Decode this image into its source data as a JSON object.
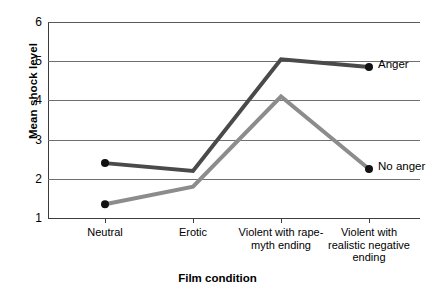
{
  "chart_data": {
    "type": "line",
    "title": "",
    "xlabel": "Film condition",
    "ylabel": "Mean shock level",
    "categories": [
      "Neutral",
      "Erotic",
      "Violent with rape-myth ending",
      "Violent with realistic negative ending"
    ],
    "series": [
      {
        "name": "Anger",
        "values": [
          2.4,
          2.2,
          5.05,
          4.85
        ],
        "color": "#4a4a4a"
      },
      {
        "name": "No anger",
        "values": [
          1.35,
          1.8,
          4.1,
          2.25
        ],
        "color": "#8c8c8c"
      }
    ],
    "ylim": [
      1,
      6
    ],
    "yticks": [
      1,
      2,
      3,
      4,
      5,
      6
    ],
    "ytick_labels": [
      "1",
      "2",
      "3",
      "4",
      "5",
      "6"
    ],
    "grid": true,
    "legend_position": "inline-right-of-last-point",
    "marker": "filled-circle-at-first-and-last-point"
  },
  "axis": {
    "y_title": "Mean shock level",
    "x_title": "Film condition",
    "y_tick_labels": [
      "6",
      "5",
      "4",
      "3",
      "2",
      "1"
    ],
    "x_tick_labels": [
      [
        "Neutral"
      ],
      [
        "Erotic"
      ],
      [
        "Violent with rape-",
        "myth ending"
      ],
      [
        "Violent with",
        "realistic negative",
        "ending"
      ]
    ]
  },
  "legend": {
    "items": [
      {
        "label": "Anger"
      },
      {
        "label": "No anger"
      }
    ]
  },
  "colors": {
    "anger_line": "#4a4a4a",
    "no_anger_line": "#8c8c8c",
    "gridline": "#6f6f6f",
    "axis": "#3d3d3d",
    "marker": "#111111",
    "background": "#ffffff"
  }
}
